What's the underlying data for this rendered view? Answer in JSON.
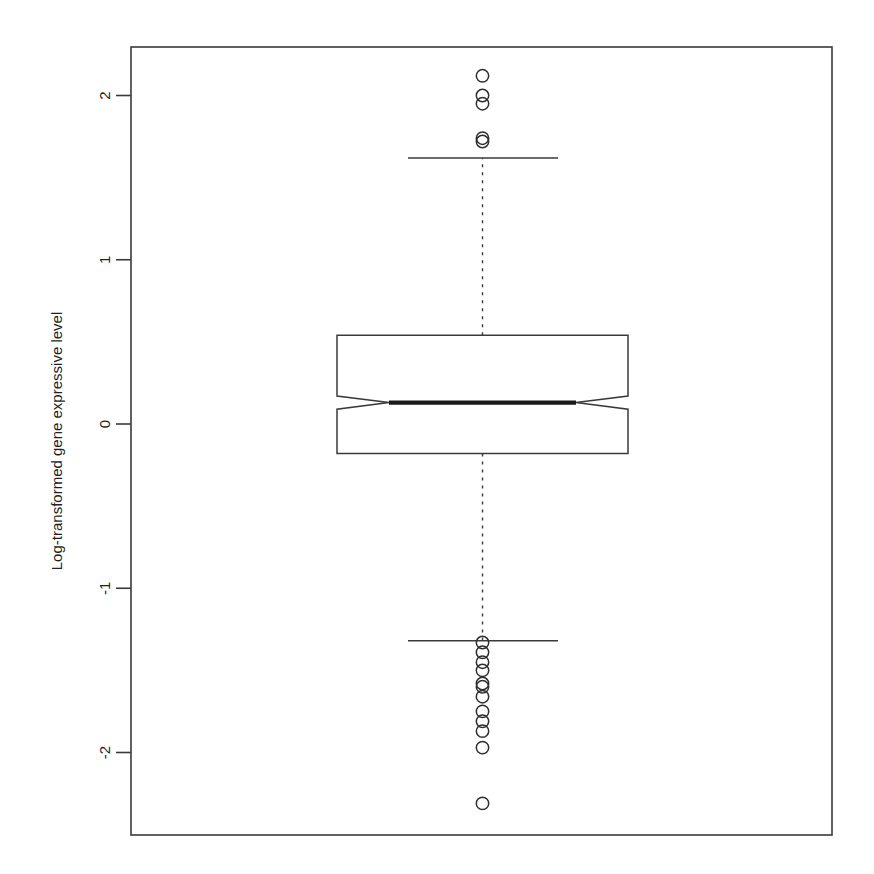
{
  "figure": {
    "background_color": "#ffffff",
    "frame_color": "#3a3a3a",
    "axis_title": "Log-transformed gene expressive level"
  },
  "chart_data": {
    "type": "box",
    "title": "",
    "xlabel": "",
    "ylabel": "Log-transformed gene expressive level",
    "ylim": [
      -2.4,
      2.3
    ],
    "grid": false,
    "legend": null,
    "notched": true,
    "categories": [
      ""
    ],
    "yticks": [
      -2,
      -1,
      0,
      1,
      2
    ],
    "ytick_labels": [
      "-2",
      "-1",
      "0",
      "1",
      "2"
    ],
    "series": [
      {
        "name": "Log-transformed gene expressive level",
        "q1": -0.18,
        "median": 0.13,
        "q3": 0.54,
        "whisker_low": -1.32,
        "whisker_high": 1.62,
        "notch_low": 0.09,
        "notch_high": 0.17,
        "outliers_high": [
          2.12,
          2.0,
          1.95,
          1.74,
          1.72
        ],
        "outliers_low": [
          -1.33,
          -1.39,
          -1.45,
          -1.5,
          -1.58,
          -1.6,
          -1.66,
          -1.75,
          -1.81,
          -1.87,
          -1.97,
          -2.31
        ]
      }
    ]
  }
}
